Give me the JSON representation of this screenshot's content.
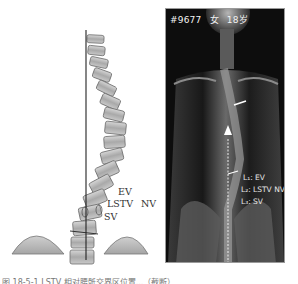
{
  "figure": {
    "left_panel": {
      "title": "Schematic spine diagram",
      "labels": {
        "ev": "EV",
        "lstv": "LSTV",
        "nv": "NV",
        "sv": "SV"
      }
    },
    "right_panel": {
      "header": {
        "patient_id": "#9677",
        "sex": "女",
        "age": "18岁"
      },
      "labels": {
        "l1": "L₁: EV",
        "l2": "L₂: LSTV NV",
        "l3": "L₃: SV"
      }
    },
    "caption": "图 18-5-1  LSTV 相对腰骶交界区位置...（截断）"
  },
  "colors": {
    "xray_bg": "#0d0d0d",
    "vertebra_fill": "#b8b8b8",
    "vertebra_stroke": "#6e6e6e",
    "plumb_line": "#222222",
    "label_text_dark": "#333333",
    "label_text_light": "#e8e8e8"
  }
}
